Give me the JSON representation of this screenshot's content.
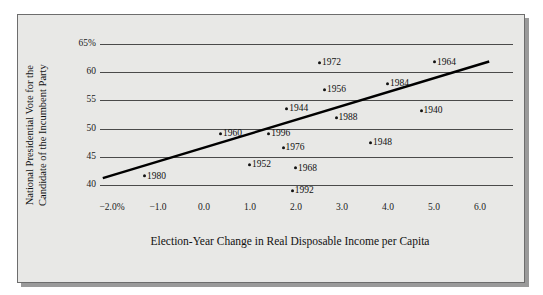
{
  "chart_data": {
    "type": "scatter",
    "title": "",
    "xlabel": "Election-Year Change in Real Disposable Income per Capita",
    "ylabel_lines": [
      "National Presidential Vote for the",
      "Candidate of the Incumbent Party"
    ],
    "xlim": [
      -2.5,
      6.5
    ],
    "ylim": [
      38.0,
      66.5
    ],
    "xticks": [
      -2.0,
      -1.0,
      0.0,
      1.0,
      2.0,
      3.0,
      4.0,
      5.0,
      6.0
    ],
    "xtick_labels": [
      "−2.0%",
      "−1.0",
      "0.0",
      "1.0",
      "2.0",
      "3.0",
      "4.0",
      "5.0",
      "6.0"
    ],
    "yticks": [
      65,
      60,
      55,
      50,
      45,
      40
    ],
    "ytick_labels": [
      "65%",
      "60",
      "55",
      "50",
      "45",
      "40"
    ],
    "grid": "horizontal",
    "legend": "none",
    "point_label_position": "right-of-dot",
    "points": [
      {
        "label": "1964",
        "x": 5.02,
        "y": 61.7
      },
      {
        "label": "1972",
        "x": 2.52,
        "y": 61.6
      },
      {
        "label": "1984",
        "x": 4.0,
        "y": 57.9
      },
      {
        "label": "1956",
        "x": 2.63,
        "y": 56.8
      },
      {
        "label": "1944",
        "x": 1.81,
        "y": 53.5
      },
      {
        "label": "1940",
        "x": 4.73,
        "y": 53.1
      },
      {
        "label": "1988",
        "x": 2.88,
        "y": 51.8
      },
      {
        "label": "1960",
        "x": 0.37,
        "y": 49.0
      },
      {
        "label": "1996",
        "x": 1.42,
        "y": 49.0
      },
      {
        "label": "1948",
        "x": 3.63,
        "y": 47.5
      },
      {
        "label": "1976",
        "x": 1.73,
        "y": 46.5
      },
      {
        "label": "1952",
        "x": 1.0,
        "y": 43.5
      },
      {
        "label": "1968",
        "x": 2.0,
        "y": 42.9
      },
      {
        "label": "1980",
        "x": -1.28,
        "y": 41.5
      },
      {
        "label": "1992",
        "x": 1.93,
        "y": 38.9
      }
    ],
    "trendline": {
      "type": "linear-fit",
      "x_start": -2.2,
      "y_start": 41.2,
      "x_end": 6.2,
      "y_end": 61.9,
      "color": "#000000"
    },
    "colors": {
      "plot_background": "#e8e8e6",
      "frame_border": "#6d6d6d",
      "gridline": "#4a4a4a",
      "point": "#111111",
      "text": "#111111"
    }
  }
}
